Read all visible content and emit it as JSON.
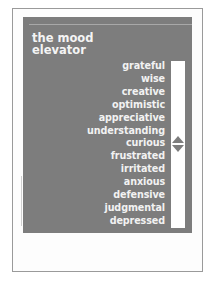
{
  "title": {
    "line1": "the mood",
    "line2": "elevator"
  },
  "scale": {
    "words": [
      "grateful",
      "wise",
      "creative",
      "optimistic",
      "appreciative",
      "understanding",
      "curious",
      "frustrated",
      "irritated",
      "anxious",
      "defensive",
      "judgmental",
      "depressed"
    ],
    "indicator_icon": "up-down-arrow-icon"
  },
  "colors": {
    "panel": "#7d7d7d",
    "text": "#f2f2f2",
    "bar": "#ffffff",
    "page": "#ffffff"
  }
}
